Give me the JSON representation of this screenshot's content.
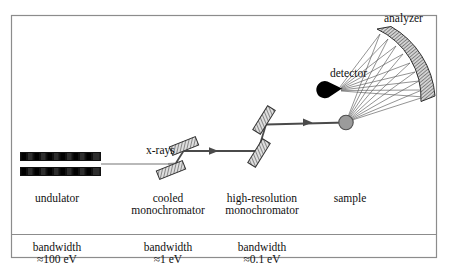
{
  "figure": {
    "title_hidden": "",
    "frame": {
      "stroke": "#8c8c8c"
    },
    "background": "#ffffff"
  },
  "labels": {
    "analyzer": "analyzer",
    "detector": "detector",
    "xrays": "x-rays"
  },
  "columns": [
    {
      "key": "undulator",
      "name": "undulator",
      "bandwidth_line1": "bandwidth",
      "bandwidth_line2": "≈100 eV"
    },
    {
      "key": "cooled",
      "name": "cooled\nmonochromator",
      "bandwidth_line1": "bandwidth",
      "bandwidth_line2": "≈1 eV"
    },
    {
      "key": "hires",
      "name": "high-resolution\nmonochromator",
      "bandwidth_line1": "bandwidth",
      "bandwidth_line2": "≈0.1 eV"
    },
    {
      "key": "sample",
      "name": "sample",
      "bandwidth_line1": "",
      "bandwidth_line2": ""
    }
  ],
  "column_text": {
    "undulator_name_l1": "undulator",
    "undulator_name_l2": "",
    "cooled_name_l1": "cooled",
    "cooled_name_l2": "monochromator",
    "hires_name_l1": "high-resolution",
    "hires_name_l2": "monochromator",
    "sample_name_l1": "sample",
    "sample_name_l2": "",
    "undulator_band_l1": "bandwidth",
    "undulator_band_l2": "≈100 eV",
    "cooled_band_l1": "bandwidth",
    "cooled_band_l2": "≈1 eV",
    "hires_band_l1": "bandwidth",
    "hires_band_l2": "≈0.1 eV"
  },
  "components": {
    "undulator": {
      "name": "undulator-magnet-array",
      "segments": 11,
      "bar_color_dark": "#050505",
      "bar_color_mid": "#2a2a2a"
    },
    "cooled_monochromator": {
      "name": "cooled-monochromator-crystals",
      "crystals": 2,
      "fill": "#d9d9d9",
      "stroke": "#3a3a3a"
    },
    "hires_monochromator": {
      "name": "high-resolution-monochromator-crystals",
      "crystals": 2,
      "fill": "#d9d9d9",
      "stroke": "#3a3a3a"
    },
    "sample": {
      "name": "sample-sphere",
      "fill": "#9b9b9b",
      "stroke": "#4a4a4a"
    },
    "analyzer": {
      "name": "analyzer-curved-crystal",
      "fill": "#c8c8c8",
      "stroke": "#333333"
    },
    "detector": {
      "name": "detector-cone",
      "fill": "#000000"
    },
    "beam": {
      "name": "x-ray-beam-path",
      "stroke_bright": "#4a4a4a",
      "stroke_dim": "#b5b5b5"
    },
    "rays": {
      "name": "analyzer-ray-fan",
      "count": 9,
      "stroke": "#555555"
    }
  }
}
